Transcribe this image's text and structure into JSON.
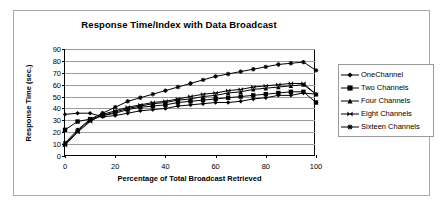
{
  "chart_data": {
    "type": "line",
    "title": "Response Time/Index with Data Broadcast",
    "xlabel": "Percentage of Total Broadcast Retrieved",
    "ylabel": "Response Time (sec.)",
    "xlim": [
      0,
      100
    ],
    "ylim": [
      0,
      90
    ],
    "xticks": [
      0,
      20,
      40,
      60,
      80,
      100
    ],
    "yticks": [
      0,
      10,
      20,
      30,
      40,
      50,
      60,
      70,
      80,
      90
    ],
    "grid": "horizontal",
    "legend_position": "right",
    "x": [
      0,
      5,
      10,
      15,
      20,
      25,
      30,
      35,
      40,
      45,
      50,
      55,
      60,
      65,
      70,
      75,
      80,
      85,
      90,
      95,
      100
    ],
    "series": [
      {
        "name": "OneChannel",
        "marker": "diamond",
        "values": [
          35,
          36,
          36,
          33,
          34,
          36,
          38,
          39,
          40,
          42,
          43,
          44,
          45,
          45,
          46,
          48,
          49,
          51,
          51,
          53,
          52
        ]
      },
      {
        "name": "Two Channels",
        "marker": "square",
        "values": [
          22,
          29,
          31,
          34,
          36,
          39,
          41,
          42,
          43,
          45,
          46,
          47,
          48,
          49,
          50,
          51,
          52,
          53,
          54,
          54,
          45
        ]
      },
      {
        "name": "Four Channels",
        "marker": "triangle",
        "values": [
          10,
          21,
          30,
          34,
          37,
          40,
          42,
          44,
          45,
          47,
          48,
          50,
          51,
          53,
          54,
          56,
          57,
          58,
          59,
          60,
          52
        ]
      },
      {
        "name": "Eight Channels",
        "marker": "bowtie",
        "values": [
          9,
          20,
          29,
          35,
          38,
          41,
          43,
          45,
          46,
          48,
          50,
          52,
          53,
          55,
          56,
          58,
          59,
          60,
          61,
          61,
          52
        ]
      },
      {
        "name": "Sixteen Channels",
        "marker": "asterisk",
        "values": [
          11,
          22,
          31,
          36,
          41,
          46,
          49,
          52,
          55,
          58,
          61,
          64,
          67,
          69,
          71,
          73,
          75,
          77,
          78,
          79,
          72
        ]
      }
    ]
  }
}
